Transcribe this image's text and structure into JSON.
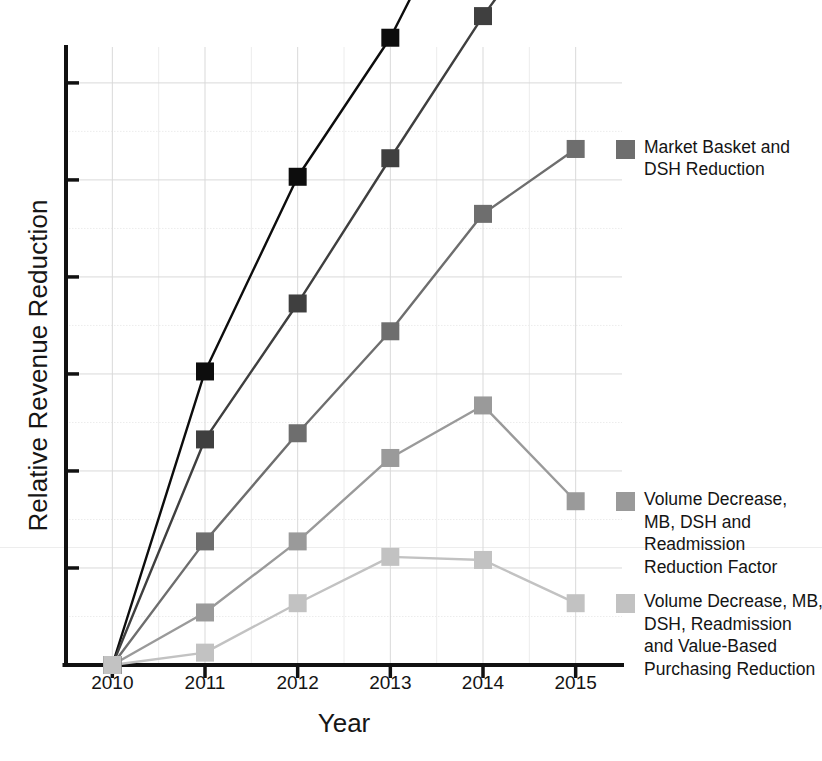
{
  "chart_data": {
    "type": "line",
    "title": "",
    "xlabel": "Year",
    "ylabel": "Relative Revenue Reduction",
    "categories": [
      "2010",
      "2011",
      "2012",
      "2013",
      "2014",
      "2015"
    ],
    "x": [
      2010,
      2011,
      2012,
      2013,
      2014,
      2015
    ],
    "xlim": [
      2010,
      2015
    ],
    "ylim": [
      0,
      100
    ],
    "y_axis_tick_labels": [],
    "y_axis_note": "Y axis is unlabeled (relative scale); major tick marks only",
    "grid": true,
    "grid_orientation": "both",
    "legend_position": "right-inline-at-line-end",
    "marker": "square",
    "series": [
      {
        "name": "Continuation of\nStatus Quo",
        "color": "#0d0d0d",
        "values": [
          0,
          47.5,
          79.0,
          101.5,
          131.0,
          155.0
        ]
      },
      {
        "name": "Market Basket (MB)\nReduction Only\nScenario",
        "color": "#3f3f3f",
        "values": [
          0,
          36.5,
          58.5,
          82.0,
          105.0,
          125.5
        ]
      },
      {
        "name": "Market Basket and\nDSH Reduction",
        "color": "#6e6e6e",
        "values": [
          0,
          20.0,
          37.5,
          54.0,
          73.0,
          83.5
        ]
      },
      {
        "name": "Volume Decrease,\nMB, DSH and\nReadmission\nReduction Factor",
        "color": "#9a9a9a",
        "values": [
          0,
          8.5,
          20.0,
          33.5,
          42.0,
          26.5
        ]
      },
      {
        "name": "Volume Decrease, MB,\nDSH, Readmission\nand Value-Based\nPurchasing Reduction",
        "color": "#c2c2c2",
        "values": [
          0,
          2.0,
          10.0,
          17.5,
          17.0,
          10.0
        ]
      }
    ]
  },
  "axes": {
    "y_title": "Relative Revenue Reduction",
    "x_title": "Year"
  },
  "legend": [
    {
      "label": "Continuation of\nStatus Quo",
      "color": "#0d0d0d"
    },
    {
      "label": "Market Basket (MB)\nReduction Only\nScenario",
      "color": "#3f3f3f"
    },
    {
      "label": "Market Basket and\nDSH Reduction",
      "color": "#6e6e6e"
    },
    {
      "label": "Volume Decrease,\nMB, DSH and\nReadmission\nReduction Factor",
      "color": "#9a9a9a"
    },
    {
      "label": "Volume Decrease, MB,\nDSH, Readmission\nand Value-Based\nPurchasing Reduction",
      "color": "#c2c2c2"
    }
  ],
  "x_tick_labels": [
    "2010",
    "2011",
    "2012",
    "2013",
    "2014",
    "2015"
  ],
  "colors": {
    "axis": "#111111",
    "grid_major": "#d9d9d9",
    "grid_minor": "#ececec",
    "background": "#ffffff"
  }
}
